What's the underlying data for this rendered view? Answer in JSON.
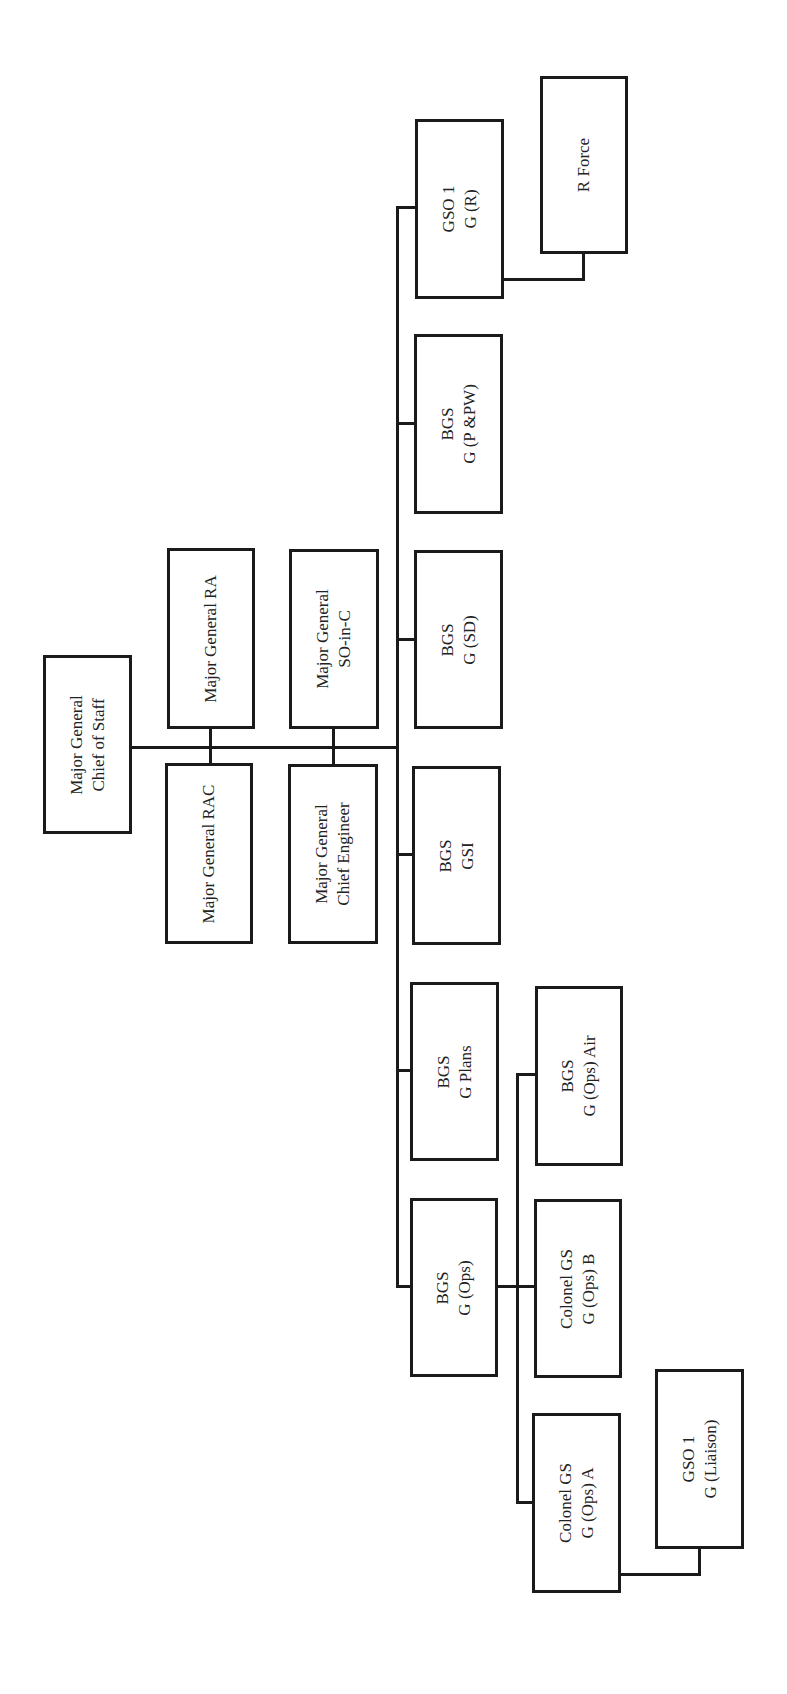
{
  "diagram": {
    "type": "org-chart",
    "orientation": "rotated-90-ccw",
    "colors": {
      "line": "#1a1a1a",
      "box_border": "#1a1a1a",
      "text": "#222222",
      "background": "#ffffff"
    },
    "nodes": {
      "chief_of_staff": {
        "lines": [
          "Major General",
          "Chief of Staff"
        ]
      },
      "mg_ra": {
        "lines": [
          "Major General RA"
        ]
      },
      "mg_rac": {
        "lines": [
          "Major General RAC"
        ]
      },
      "mg_so_in_c": {
        "lines": [
          "Major General",
          "SO-in-C"
        ]
      },
      "mg_chief_eng": {
        "lines": [
          "Major General",
          "Chief Engineer"
        ]
      },
      "gso1_gr": {
        "lines": [
          "GSO 1",
          "G (R)"
        ]
      },
      "r_force": {
        "lines": [
          "R Force"
        ]
      },
      "bgs_ppw": {
        "lines": [
          "BGS",
          "G (P &PW)"
        ]
      },
      "bgs_sd": {
        "lines": [
          "BGS",
          "G (SD)"
        ]
      },
      "bgs_gsi": {
        "lines": [
          "BGS",
          "GSI"
        ]
      },
      "bgs_plans": {
        "lines": [
          "BGS",
          "G Plans"
        ]
      },
      "bgs_ops": {
        "lines": [
          "BGS",
          "G (Ops)"
        ]
      },
      "bgs_ops_air": {
        "lines": [
          "BGS",
          "G (Ops) Air"
        ]
      },
      "col_ops_b": {
        "lines": [
          "Colonel GS",
          "G (Ops) B"
        ]
      },
      "col_ops_a": {
        "lines": [
          "Colonel GS",
          "G (Ops) A"
        ]
      },
      "gso1_liaison": {
        "lines": [
          "GSO 1",
          "G (Liaison)"
        ]
      }
    },
    "edges": [
      [
        "chief_of_staff",
        "mg_ra"
      ],
      [
        "chief_of_staff",
        "mg_rac"
      ],
      [
        "chief_of_staff",
        "mg_so_in_c"
      ],
      [
        "chief_of_staff",
        "mg_chief_eng"
      ],
      [
        "chief_of_staff",
        "gso1_gr"
      ],
      [
        "chief_of_staff",
        "bgs_ppw"
      ],
      [
        "chief_of_staff",
        "bgs_sd"
      ],
      [
        "chief_of_staff",
        "bgs_gsi"
      ],
      [
        "chief_of_staff",
        "bgs_plans"
      ],
      [
        "chief_of_staff",
        "bgs_ops"
      ],
      [
        "gso1_gr",
        "r_force"
      ],
      [
        "bgs_ops",
        "bgs_ops_air"
      ],
      [
        "bgs_ops",
        "col_ops_b"
      ],
      [
        "bgs_ops",
        "col_ops_a"
      ],
      [
        "col_ops_a",
        "gso1_liaison"
      ]
    ]
  }
}
